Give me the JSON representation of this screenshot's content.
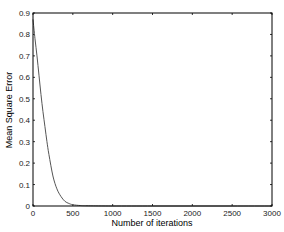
{
  "chart_data": {
    "type": "line",
    "title": "",
    "xlabel": "Number of iterations",
    "ylabel": "Mean Square Error",
    "xlim": [
      0,
      3000
    ],
    "ylim": [
      0,
      0.9
    ],
    "xticks": [
      0,
      500,
      1000,
      1500,
      2000,
      2500,
      3000
    ],
    "yticks": [
      0,
      0.1,
      0.2,
      0.3,
      0.4,
      0.5,
      0.6,
      0.7,
      0.8,
      0.9
    ],
    "xtick_labels": [
      "0",
      "500",
      "1000",
      "1500",
      "2000",
      "2500",
      "3000"
    ],
    "ytick_labels": [
      "0",
      "0.1",
      "0.2",
      "0.3",
      "0.4",
      "0.5",
      "0.6",
      "0.7",
      "0.8",
      "0.9"
    ],
    "grid": false,
    "legend": null,
    "series": [
      {
        "name": "MSE",
        "color": "#555555",
        "x": [
          0,
          25,
          50,
          75,
          100,
          125,
          150,
          175,
          200,
          250,
          300,
          350,
          400,
          450,
          500,
          600,
          700,
          1000,
          1500,
          2000,
          2500,
          3000
        ],
        "y": [
          0.87,
          0.78,
          0.7,
          0.61,
          0.52,
          0.44,
          0.37,
          0.3,
          0.24,
          0.14,
          0.08,
          0.045,
          0.022,
          0.012,
          0.006,
          0.002,
          0.001,
          0.0,
          0.0,
          0.0,
          0.0,
          0.0
        ]
      }
    ]
  }
}
